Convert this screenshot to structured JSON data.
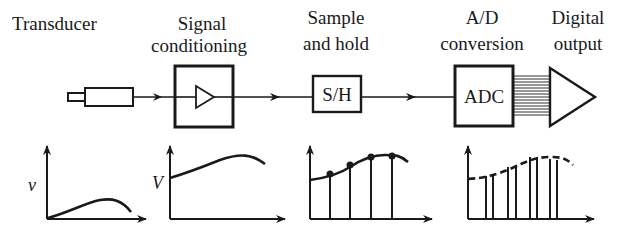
{
  "stages": [
    {
      "id": "transducer",
      "label_lines": [
        "Transducer"
      ]
    },
    {
      "id": "signal-conditioning",
      "label_lines": [
        "Signal",
        "conditioning"
      ]
    },
    {
      "id": "sample-and-hold",
      "label_lines": [
        "Sample",
        "and hold"
      ],
      "box_text": "S/H"
    },
    {
      "id": "ad-conversion",
      "label_lines": [
        "A/D",
        "conversion"
      ],
      "box_text": "ADC"
    },
    {
      "id": "digital-output",
      "label_lines": [
        "Digital",
        "output"
      ]
    }
  ],
  "graphs": {
    "transducer": {
      "y_label": "v"
    },
    "signal_conditioning": {
      "y_label": "V"
    },
    "sample_and_hold": {
      "y_label": ""
    },
    "ad_conversion": {
      "y_label": ""
    }
  },
  "colors": {
    "ink": "#1a1a1a",
    "background": "#ffffff"
  }
}
